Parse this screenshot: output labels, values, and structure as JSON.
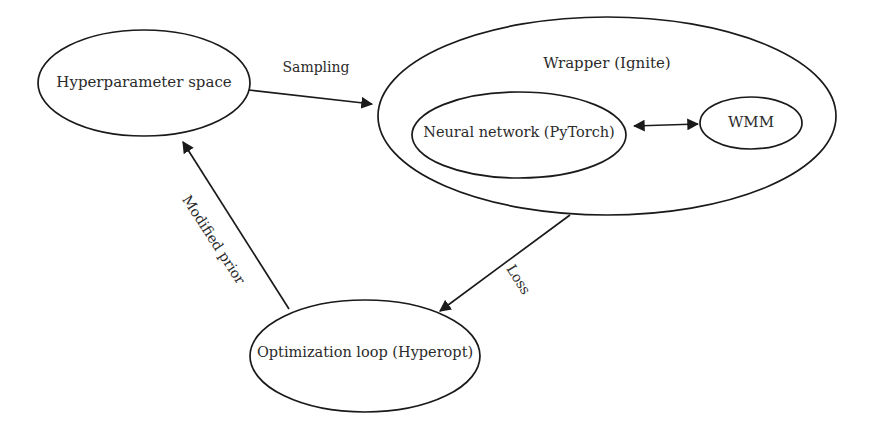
{
  "diagram": {
    "background_color": "#ffffff",
    "stroke_color": "#1a1a1a",
    "text_color": "#2b2b2b",
    "nodes": [
      {
        "id": "hyperparameter-space",
        "label": "Hyperparameter space",
        "shape": "ellipse",
        "cx": 144,
        "cy": 83,
        "rx": 106,
        "ry": 53
      },
      {
        "id": "wrapper-ignite",
        "label": "Wrapper (Ignite)",
        "shape": "ellipse",
        "cx": 607,
        "cy": 116,
        "rx": 229,
        "ry": 99
      },
      {
        "id": "neural-network-pytorch",
        "label": "Neural network (PyTorch)",
        "shape": "ellipse",
        "cx": 519,
        "cy": 135,
        "rx": 107,
        "ry": 43
      },
      {
        "id": "wmm",
        "label": "WMM",
        "shape": "ellipse",
        "cx": 751,
        "cy": 123,
        "rx": 51,
        "ry": 26
      },
      {
        "id": "optimization-loop-hyperopt",
        "label": "Optimization loop (Hyperopt)",
        "shape": "ellipse",
        "cx": 365,
        "cy": 356,
        "rx": 115,
        "ry": 56
      }
    ],
    "edges": [
      {
        "id": "sampling-edge",
        "label": "Sampling",
        "from": "hyperparameter-space",
        "to": "wrapper-ignite",
        "arrow": "single",
        "label_x": 316,
        "label_y": 68,
        "label_rotation": 0
      },
      {
        "id": "nn-wmm-edge",
        "label": "",
        "from": "neural-network-pytorch",
        "to": "wmm",
        "arrow": "double",
        "label_x": 0,
        "label_y": 0,
        "label_rotation": 0
      },
      {
        "id": "loss-edge",
        "label": "Loss",
        "from": "wrapper-ignite",
        "to": "optimization-loop-hyperopt",
        "arrow": "single",
        "label_x": 518,
        "label_y": 280,
        "label_rotation": 58
      },
      {
        "id": "modified-prior-edge",
        "label": "Modified prior",
        "from": "optimization-loop-hyperopt",
        "to": "hyperparameter-space",
        "arrow": "single",
        "label_x": 213,
        "label_y": 240,
        "label_rotation": 57
      }
    ]
  }
}
